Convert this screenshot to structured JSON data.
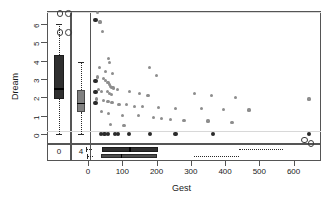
{
  "chart_data": {
    "type": "scatter",
    "title": "",
    "xlabel": "Gest",
    "ylabel": "Dream",
    "xlim": [
      -120,
      680
    ],
    "ylim": [
      -0.55,
      6.7
    ],
    "xticks": [
      0,
      100,
      200,
      300,
      400,
      500,
      600
    ],
    "xticklabels": [
      "0",
      "100",
      "200",
      "300",
      "400",
      "500",
      "600"
    ],
    "yticks": [
      0,
      1,
      2,
      3,
      4,
      5,
      6
    ],
    "yticklabels": [
      "0",
      "1",
      "2",
      "3",
      "4",
      "5",
      "6"
    ],
    "grid": false,
    "legend": null,
    "marginal_group_labels": [
      "0",
      "4"
    ],
    "points": [
      {
        "x": 28,
        "y": 6.6
      },
      {
        "x": 35,
        "y": 6.1
      },
      {
        "x": 42,
        "y": 5.6
      },
      {
        "x": 60,
        "y": 4.1
      },
      {
        "x": 63,
        "y": 3.9
      },
      {
        "x": 33,
        "y": 3.6
      },
      {
        "x": 50,
        "y": 3.4
      },
      {
        "x": 72,
        "y": 3.3
      },
      {
        "x": 180,
        "y": 3.6
      },
      {
        "x": 200,
        "y": 3.2
      },
      {
        "x": 28,
        "y": 3.1
      },
      {
        "x": 45,
        "y": 3.0
      },
      {
        "x": 52,
        "y": 2.9
      },
      {
        "x": 58,
        "y": 2.8
      },
      {
        "x": 63,
        "y": 2.7
      },
      {
        "x": 66,
        "y": 2.6
      },
      {
        "x": 70,
        "y": 2.55
      },
      {
        "x": 75,
        "y": 2.5
      },
      {
        "x": 30,
        "y": 2.4
      },
      {
        "x": 40,
        "y": 2.3
      },
      {
        "x": 56,
        "y": 2.3
      },
      {
        "x": 62,
        "y": 2.2
      },
      {
        "x": 68,
        "y": 2.15
      },
      {
        "x": 85,
        "y": 2.4
      },
      {
        "x": 120,
        "y": 2.3
      },
      {
        "x": 150,
        "y": 2.2
      },
      {
        "x": 175,
        "y": 2.1
      },
      {
        "x": 310,
        "y": 2.2
      },
      {
        "x": 360,
        "y": 2.1
      },
      {
        "x": 430,
        "y": 2.0
      },
      {
        "x": 645,
        "y": 1.9
      },
      {
        "x": 25,
        "y": 1.9
      },
      {
        "x": 44,
        "y": 1.8
      },
      {
        "x": 58,
        "y": 1.75
      },
      {
        "x": 70,
        "y": 1.7
      },
      {
        "x": 90,
        "y": 1.6
      },
      {
        "x": 112,
        "y": 1.6
      },
      {
        "x": 135,
        "y": 1.5
      },
      {
        "x": 160,
        "y": 1.5
      },
      {
        "x": 205,
        "y": 1.45
      },
      {
        "x": 255,
        "y": 1.4
      },
      {
        "x": 330,
        "y": 1.4
      },
      {
        "x": 395,
        "y": 1.35
      },
      {
        "x": 470,
        "y": 1.3
      },
      {
        "x": 40,
        "y": 1.2
      },
      {
        "x": 60,
        "y": 1.1
      },
      {
        "x": 100,
        "y": 1.0
      },
      {
        "x": 148,
        "y": 1.0
      },
      {
        "x": 190,
        "y": 0.9
      },
      {
        "x": 215,
        "y": 0.85
      },
      {
        "x": 240,
        "y": 0.8
      },
      {
        "x": 280,
        "y": 0.75
      },
      {
        "x": 350,
        "y": 0.7
      },
      {
        "x": 420,
        "y": 0.6
      },
      {
        "x": 65,
        "y": 0.5
      },
      {
        "x": 105,
        "y": 0.45
      }
    ],
    "points_dark": [
      {
        "x": 22,
        "y": 6.2
      },
      {
        "x": 22,
        "y": 2.9
      },
      {
        "x": 22,
        "y": 2.3
      },
      {
        "x": 22,
        "y": 1.7
      },
      {
        "x": 38,
        "y": 0.0
      },
      {
        "x": 48,
        "y": 0.0
      },
      {
        "x": 58,
        "y": 0.0
      },
      {
        "x": 78,
        "y": 0.0
      },
      {
        "x": 88,
        "y": 0.0
      },
      {
        "x": 120,
        "y": 0.0
      },
      {
        "x": 180,
        "y": 0.0
      },
      {
        "x": 255,
        "y": 0.0
      },
      {
        "x": 365,
        "y": 0.0
      },
      {
        "x": 645,
        "y": 0.0
      }
    ],
    "points_open": [
      {
        "x": -60,
        "y": 6.6
      },
      {
        "x": -60,
        "y": 5.6
      },
      {
        "x": 630,
        "y": -0.28
      },
      {
        "x": 648,
        "y": -0.46
      }
    ],
    "vertical_boxplots": [
      {
        "group": "0",
        "min": 0.0,
        "q1": 1.9,
        "median": 2.5,
        "q3": 4.3,
        "max": 6.0,
        "outliers": [
          6.6,
          5.6
        ]
      },
      {
        "group": "4",
        "min": 0.0,
        "q1": 1.2,
        "median": 1.7,
        "q3": 2.4,
        "max": 3.9,
        "outliers": []
      }
    ],
    "horizontal_boxplots": [
      {
        "group": "0",
        "min": 12,
        "q1": 42,
        "median": 120,
        "q3": 205,
        "max": 440,
        "outliers": [
          630
        ]
      },
      {
        "group": "4",
        "min": 15,
        "q1": 38,
        "median": 95,
        "q3": 200,
        "max": 310,
        "outliers": [
          648
        ]
      }
    ]
  }
}
